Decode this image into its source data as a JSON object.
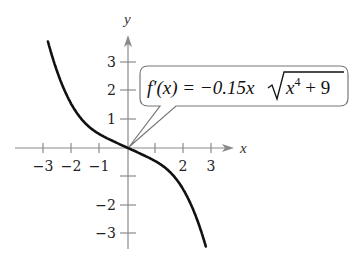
{
  "chart_data": {
    "type": "line",
    "title": "",
    "xlabel": "x",
    "ylabel": "y",
    "xlim": [
      -3,
      3
    ],
    "ylim": [
      -3,
      3
    ],
    "grid": false,
    "x_ticks": [
      -3,
      -2,
      -1,
      1,
      2,
      3
    ],
    "x_tick_labels": [
      "−3",
      "−2",
      "−1",
      "",
      "2",
      "3"
    ],
    "y_ticks": [
      -3,
      -2,
      -1,
      1,
      2,
      3
    ],
    "y_tick_labels": [
      "−3",
      "−2",
      "",
      "1",
      "2",
      "3"
    ],
    "series": [
      {
        "name": "f'(x) = −0.15x√(x⁴+9)",
        "function": "-0.15*x*sqrt(x^4+9)",
        "x": [
          -2.85,
          -2.5,
          -2.0,
          -1.5,
          -1.0,
          -0.5,
          0,
          0.5,
          1.0,
          1.5,
          2.0,
          2.5,
          2.78
        ],
        "values": [
          3.58,
          2.71,
          1.5,
          0.84,
          0.47,
          0.23,
          0,
          -0.23,
          -0.47,
          -0.84,
          -1.5,
          -2.71,
          -3.35
        ]
      }
    ],
    "annotations": [
      {
        "text": "f'(x) = −0.15x√(x⁴ + 9)",
        "type": "callout",
        "points_to": [
          0,
          0
        ]
      }
    ]
  },
  "labels": {
    "x_axis": "x",
    "y_axis": "y",
    "formula_prefix": "f′(x) = −0.15x",
    "formula_radicand_base": "x",
    "formula_exponent": "4",
    "formula_radicand_rest": " + 9"
  },
  "ticks": {
    "x": [
      {
        "label": "−3",
        "px": 43
      },
      {
        "label": "−2",
        "px": 71
      },
      {
        "label": "−1",
        "px": 99
      },
      {
        "label": "",
        "px": 155
      },
      {
        "label": "2",
        "px": 183
      },
      {
        "label": "3",
        "px": 211
      }
    ],
    "y": [
      {
        "label": "3",
        "py": 62
      },
      {
        "label": "2",
        "py": 90
      },
      {
        "label": "1",
        "py": 119
      },
      {
        "label": "",
        "py": 176
      },
      {
        "label": "−2",
        "py": 205
      },
      {
        "label": "−3",
        "py": 233
      }
    ]
  }
}
